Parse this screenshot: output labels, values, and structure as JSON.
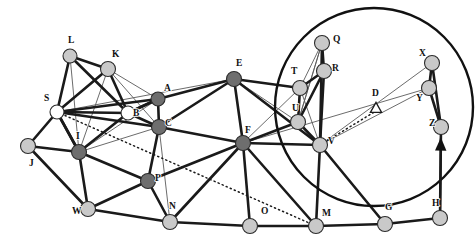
{
  "figure": {
    "type": "graph-diagram",
    "background": "#ffffff",
    "width": 476,
    "height": 245,
    "colors": {
      "edge_thick": "#1a1a1a",
      "edge_thin": "#5a5a5a",
      "dotted": "#1a1a1a",
      "node_light": "#c9c9c9",
      "node_dark": "#6e6e6e",
      "node_white": "#ffffff",
      "node_stroke": "#2b2b2b",
      "circle_stroke": "#111111",
      "label": "#111111"
    }
  },
  "nodes": [
    {
      "id": "L",
      "label": "L",
      "x": 70,
      "y": 56,
      "r": 7.0,
      "fill": "node_light",
      "lx": 68,
      "ly": 43
    },
    {
      "id": "K",
      "label": "K",
      "x": 108,
      "y": 69,
      "r": 7.5,
      "fill": "node_light",
      "lx": 112,
      "ly": 57
    },
    {
      "id": "S",
      "label": "S",
      "x": 57,
      "y": 112,
      "r": 7.0,
      "fill": "node_white",
      "lx": 44,
      "ly": 101
    },
    {
      "id": "B",
      "label": "B",
      "x": 128,
      "y": 113,
      "r": 7.0,
      "fill": "node_white",
      "lx": 133,
      "ly": 116
    },
    {
      "id": "A",
      "label": "A",
      "x": 158,
      "y": 99,
      "r": 7.0,
      "fill": "node_dark",
      "lx": 164,
      "ly": 91
    },
    {
      "id": "C",
      "label": "C",
      "x": 159,
      "y": 127,
      "r": 7.5,
      "fill": "node_dark",
      "lx": 165,
      "ly": 126
    },
    {
      "id": "E",
      "label": "E",
      "x": 234,
      "y": 79,
      "r": 7.5,
      "fill": "node_dark",
      "lx": 236,
      "ly": 66
    },
    {
      "id": "F",
      "label": "F",
      "x": 243,
      "y": 143,
      "r": 7.5,
      "fill": "node_dark",
      "lx": 245,
      "ly": 133
    },
    {
      "id": "I",
      "label": "I",
      "x": 79,
      "y": 152,
      "r": 7.5,
      "fill": "node_dark",
      "lx": 76,
      "ly": 139
    },
    {
      "id": "J",
      "label": "J",
      "x": 28,
      "y": 146,
      "r": 7.5,
      "fill": "node_light",
      "lx": 29,
      "ly": 166
    },
    {
      "id": "W",
      "label": "W",
      "x": 88,
      "y": 209,
      "r": 7.5,
      "fill": "node_light",
      "lx": 72,
      "ly": 214
    },
    {
      "id": "P",
      "label": "P",
      "x": 148,
      "y": 181,
      "r": 7.5,
      "fill": "node_dark",
      "lx": 155,
      "ly": 181
    },
    {
      "id": "N",
      "label": "N",
      "x": 170,
      "y": 222,
      "r": 7.5,
      "fill": "node_light",
      "lx": 169,
      "ly": 209
    },
    {
      "id": "O",
      "label": "O",
      "x": 250,
      "y": 226,
      "r": 7.5,
      "fill": "node_light",
      "lx": 261,
      "ly": 214
    },
    {
      "id": "M",
      "label": "M",
      "x": 316,
      "y": 226,
      "r": 7.5,
      "fill": "node_light",
      "lx": 322,
      "ly": 216
    },
    {
      "id": "G",
      "label": "G",
      "x": 385,
      "y": 224,
      "r": 7.5,
      "fill": "node_light",
      "lx": 385,
      "ly": 210
    },
    {
      "id": "H",
      "label": "H",
      "x": 440,
      "y": 218,
      "r": 7.5,
      "fill": "node_light",
      "lx": 432,
      "ly": 206
    },
    {
      "id": "Q",
      "label": "Q",
      "x": 322,
      "y": 43,
      "r": 7.5,
      "fill": "node_light",
      "lx": 333,
      "ly": 42
    },
    {
      "id": "R",
      "label": "R",
      "x": 324,
      "y": 71,
      "r": 7.5,
      "fill": "node_light",
      "lx": 332,
      "ly": 71
    },
    {
      "id": "T",
      "label": "T",
      "x": 300,
      "y": 88,
      "r": 7.5,
      "fill": "node_light",
      "lx": 291,
      "ly": 74
    },
    {
      "id": "U",
      "label": "U",
      "x": 298,
      "y": 122,
      "r": 7.5,
      "fill": "node_light",
      "lx": 292,
      "ly": 111
    },
    {
      "id": "V",
      "label": "V",
      "x": 320,
      "y": 145,
      "r": 7.5,
      "fill": "node_light",
      "lx": 328,
      "ly": 144
    },
    {
      "id": "X",
      "label": "X",
      "x": 432,
      "y": 63,
      "r": 7.5,
      "fill": "node_light",
      "lx": 419,
      "ly": 56
    },
    {
      "id": "Y",
      "label": "Y",
      "x": 429,
      "y": 88,
      "r": 7.5,
      "fill": "node_light",
      "lx": 416,
      "ly": 101
    },
    {
      "id": "Z",
      "label": "Z",
      "x": 441,
      "y": 127,
      "r": 7.5,
      "fill": "node_light",
      "lx": 429,
      "ly": 126
    }
  ],
  "edges_thick": [
    [
      "L",
      "K"
    ],
    [
      "L",
      "S"
    ],
    [
      "K",
      "S"
    ],
    [
      "K",
      "B"
    ],
    [
      "L",
      "B"
    ],
    [
      "S",
      "B"
    ],
    [
      "S",
      "I"
    ],
    [
      "S",
      "J"
    ],
    [
      "S",
      "A"
    ],
    [
      "S",
      "C"
    ],
    [
      "B",
      "C"
    ],
    [
      "B",
      "A"
    ],
    [
      "A",
      "C"
    ],
    [
      "A",
      "E"
    ],
    [
      "A",
      "B"
    ],
    [
      "C",
      "F"
    ],
    [
      "C",
      "P"
    ],
    [
      "E",
      "F"
    ],
    [
      "E",
      "V"
    ],
    [
      "E",
      "T"
    ],
    [
      "F",
      "V"
    ],
    [
      "F",
      "U"
    ],
    [
      "F",
      "P"
    ],
    [
      "F",
      "N"
    ],
    [
      "F",
      "O"
    ],
    [
      "I",
      "J"
    ],
    [
      "I",
      "B"
    ],
    [
      "I",
      "P"
    ],
    [
      "I",
      "W"
    ],
    [
      "I",
      "S"
    ],
    [
      "W",
      "P"
    ],
    [
      "W",
      "N"
    ],
    [
      "P",
      "N"
    ],
    [
      "N",
      "O"
    ],
    [
      "O",
      "M"
    ],
    [
      "M",
      "G"
    ],
    [
      "G",
      "H"
    ],
    [
      "M",
      "V"
    ],
    [
      "V",
      "G"
    ],
    [
      "V",
      "U"
    ],
    [
      "T",
      "U"
    ],
    [
      "T",
      "R"
    ],
    [
      "Q",
      "R"
    ],
    [
      "R",
      "V"
    ],
    [
      "Q",
      "V"
    ],
    [
      "U",
      "R"
    ],
    [
      "X",
      "Y"
    ],
    [
      "Y",
      "Z"
    ],
    [
      "Z",
      "H"
    ],
    [
      "X",
      "Z"
    ],
    [
      "C",
      "E"
    ],
    [
      "F",
      "M"
    ],
    [
      "J",
      "W"
    ]
  ],
  "edges_thin": [
    [
      "L",
      "I"
    ],
    [
      "K",
      "I"
    ],
    [
      "K",
      "C"
    ],
    [
      "K",
      "A"
    ],
    [
      "S",
      "K"
    ],
    [
      "S",
      "L"
    ],
    [
      "B",
      "I"
    ],
    [
      "B",
      "K"
    ],
    [
      "I",
      "C"
    ],
    [
      "I",
      "A"
    ],
    [
      "S",
      "E"
    ],
    [
      "E",
      "U"
    ],
    [
      "E",
      "T"
    ],
    [
      "T",
      "V"
    ],
    [
      "T",
      "Q"
    ],
    [
      "U",
      "Q"
    ],
    [
      "U",
      "T"
    ],
    [
      "Q",
      "U"
    ],
    [
      "R",
      "T"
    ],
    [
      "R",
      "U"
    ],
    [
      "F",
      "T"
    ],
    [
      "F",
      "Y"
    ],
    [
      "V",
      "Y"
    ],
    [
      "V",
      "X"
    ],
    [
      "W",
      "N"
    ],
    [
      "N",
      "C"
    ],
    [
      "P",
      "C"
    ],
    [
      "F",
      "N"
    ],
    [
      "G",
      "V"
    ],
    [
      "H",
      "Z"
    ],
    [
      "M",
      "O"
    ],
    [
      "O",
      "F"
    ],
    [
      "S",
      "B"
    ],
    [
      "I",
      "B"
    ],
    [
      "B",
      "S"
    ]
  ],
  "edges_dotted": [
    [
      "S",
      "M"
    ],
    [
      "V",
      "D"
    ]
  ],
  "arrow_edge": {
    "from": "H",
    "to": "Z",
    "label": "arrow-h-to-z"
  },
  "circle": {
    "cx": 374,
    "cy": 107,
    "r": 99,
    "stroke_width": 2.4,
    "fill": "none"
  },
  "triangle": {
    "label": "D",
    "cx": 376,
    "cy": 108,
    "size": 9,
    "lx": 372,
    "ly": 96
  },
  "labels_note": "Node identifiers A,B,C,D,E,F,G,H,I,J,K,L,M,N,O,P,Q,R,S,T,U,V,W,X,Y,Z"
}
